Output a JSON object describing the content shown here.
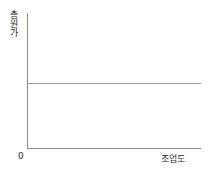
{
  "chart_data": {
    "type": "line",
    "title": "",
    "subtitle": "",
    "xlabel": "조업도",
    "ylabel": "총원가",
    "origin_label": "0",
    "grid": false,
    "legend": null,
    "xlim": [
      0,
      100
    ],
    "ylim": [
      0,
      100
    ],
    "xticks": [],
    "yticks": [],
    "series": [
      {
        "name": "총원가",
        "x": [
          0,
          100
        ],
        "values": [
          48,
          48
        ],
        "color": "#9a9a9a"
      }
    ],
    "annotations": []
  },
  "axes": {
    "y_axis_name": "y-axis",
    "x_axis_name": "x-axis",
    "axis_color": "#8a8a8a"
  },
  "plot": {
    "background": "#ffffff",
    "line_color": "#9a9a9a"
  }
}
